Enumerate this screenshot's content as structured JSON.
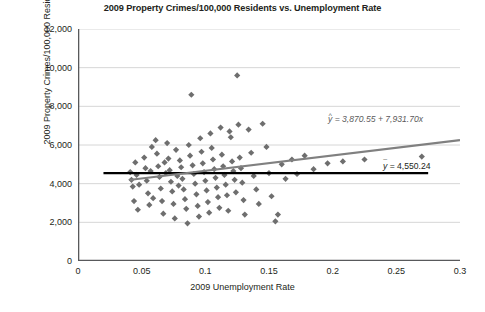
{
  "chart_data": {
    "type": "scatter",
    "title": "2009 Property Crimes/100,000 Residents vs. Unemployment Rate",
    "xlabel": "2009 Unemployment Rate",
    "ylabel": "2009 Property Crimes/100,000 Residents",
    "xlim": [
      0,
      0.3
    ],
    "ylim": [
      0,
      12000
    ],
    "xticks": [
      "0",
      "0.05",
      "0.1",
      "0.15",
      "0.2",
      "0.25",
      "0.3"
    ],
    "xtick_values": [
      0,
      0.05,
      0.1,
      0.15,
      0.2,
      0.25,
      0.3
    ],
    "yticks": [
      "0",
      "2,000",
      "4,000",
      "6,000",
      "8,000",
      "10,000",
      "12,000"
    ],
    "ytick_values": [
      0,
      2000,
      4000,
      6000,
      8000,
      10000,
      12000
    ],
    "grid": "horizontal",
    "legend": "none",
    "marker": "diamond",
    "marker_color": "#6e6e6e",
    "regression_line_color": "#808080",
    "mean_line_color": "#000000",
    "annotations": [
      {
        "name": "regression-equation",
        "text_prefix": "y",
        "text": "ŷ = 3,870.55 + 7,931.70x",
        "intercept": 3870.55,
        "slope": 7931.7,
        "color": "#5a5a5a"
      },
      {
        "name": "mean-line-label",
        "text": "ȳ = 4,550.24",
        "value": 4550.24,
        "color": "#000000"
      }
    ],
    "regression_line": {
      "x0": 0.04,
      "y0": 4188,
      "x1": 0.3,
      "y1": 6250
    },
    "mean_line": {
      "x0": 0.02,
      "y0": 4550.24,
      "x1": 0.275,
      "y1": 4550.24
    },
    "points": [
      [
        0.041,
        4600
      ],
      [
        0.042,
        4200
      ],
      [
        0.043,
        3850
      ],
      [
        0.044,
        3100
      ],
      [
        0.045,
        5100
      ],
      [
        0.046,
        4450
      ],
      [
        0.047,
        2650
      ],
      [
        0.048,
        3950
      ],
      [
        0.052,
        5350
      ],
      [
        0.053,
        4800
      ],
      [
        0.054,
        4150
      ],
      [
        0.055,
        3500
      ],
      [
        0.056,
        2900
      ],
      [
        0.057,
        4650
      ],
      [
        0.058,
        5900
      ],
      [
        0.059,
        3250
      ],
      [
        0.061,
        6250
      ],
      [
        0.062,
        5550
      ],
      [
        0.063,
        4900
      ],
      [
        0.064,
        4350
      ],
      [
        0.065,
        3750
      ],
      [
        0.066,
        3100
      ],
      [
        0.067,
        2450
      ],
      [
        0.068,
        5100
      ],
      [
        0.069,
        4550
      ],
      [
        0.07,
        6100
      ],
      [
        0.071,
        5300
      ],
      [
        0.072,
        4700
      ],
      [
        0.073,
        4100
      ],
      [
        0.074,
        3600
      ],
      [
        0.075,
        2950
      ],
      [
        0.076,
        2200
      ],
      [
        0.077,
        5750
      ],
      [
        0.078,
        4400
      ],
      [
        0.079,
        3900
      ],
      [
        0.08,
        5200
      ],
      [
        0.081,
        4850
      ],
      [
        0.082,
        4250
      ],
      [
        0.083,
        3700
      ],
      [
        0.084,
        3200
      ],
      [
        0.085,
        2700
      ],
      [
        0.086,
        1950
      ],
      [
        0.087,
        6000
      ],
      [
        0.088,
        5450
      ],
      [
        0.089,
        8600
      ],
      [
        0.09,
        4950
      ],
      [
        0.091,
        4500
      ],
      [
        0.092,
        4000
      ],
      [
        0.093,
        3450
      ],
      [
        0.094,
        2850
      ],
      [
        0.095,
        2300
      ],
      [
        0.096,
        6350
      ],
      [
        0.097,
        5650
      ],
      [
        0.098,
        5050
      ],
      [
        0.099,
        4600
      ],
      [
        0.1,
        4150
      ],
      [
        0.101,
        3650
      ],
      [
        0.102,
        3050
      ],
      [
        0.103,
        2500
      ],
      [
        0.104,
        6600
      ],
      [
        0.105,
        5850
      ],
      [
        0.106,
        5250
      ],
      [
        0.107,
        4750
      ],
      [
        0.108,
        4300
      ],
      [
        0.109,
        3800
      ],
      [
        0.11,
        3300
      ],
      [
        0.111,
        2750
      ],
      [
        0.112,
        6900
      ],
      [
        0.113,
        5500
      ],
      [
        0.114,
        4900
      ],
      [
        0.115,
        4450
      ],
      [
        0.116,
        3950
      ],
      [
        0.117,
        3400
      ],
      [
        0.118,
        2600
      ],
      [
        0.119,
        6700
      ],
      [
        0.12,
        6400
      ],
      [
        0.121,
        5150
      ],
      [
        0.122,
        4650
      ],
      [
        0.123,
        4200
      ],
      [
        0.124,
        3550
      ],
      [
        0.125,
        9600
      ],
      [
        0.126,
        7050
      ],
      [
        0.127,
        5350
      ],
      [
        0.128,
        4800
      ],
      [
        0.129,
        4050
      ],
      [
        0.13,
        3150
      ],
      [
        0.131,
        2400
      ],
      [
        0.134,
        6800
      ],
      [
        0.136,
        5600
      ],
      [
        0.138,
        4400
      ],
      [
        0.14,
        3700
      ],
      [
        0.142,
        2950
      ],
      [
        0.145,
        7100
      ],
      [
        0.148,
        5900
      ],
      [
        0.15,
        4550
      ],
      [
        0.152,
        3350
      ],
      [
        0.155,
        2050
      ],
      [
        0.157,
        2400
      ],
      [
        0.16,
        5000
      ],
      [
        0.163,
        4250
      ],
      [
        0.168,
        5250
      ],
      [
        0.172,
        4500
      ],
      [
        0.178,
        5450
      ],
      [
        0.185,
        4750
      ],
      [
        0.196,
        5050
      ],
      [
        0.208,
        5150
      ],
      [
        0.225,
        5250
      ],
      [
        0.27,
        5400
      ]
    ],
    "n_points": 110
  }
}
